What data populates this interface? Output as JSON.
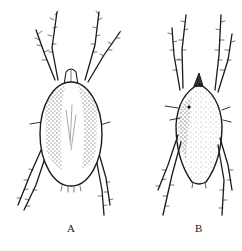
{
  "figure": {
    "panels": [
      {
        "id": "A",
        "label": "A",
        "subject": "mite-dorsal-view"
      },
      {
        "id": "B",
        "label": "B",
        "subject": "mite-dorsal-view"
      }
    ]
  }
}
